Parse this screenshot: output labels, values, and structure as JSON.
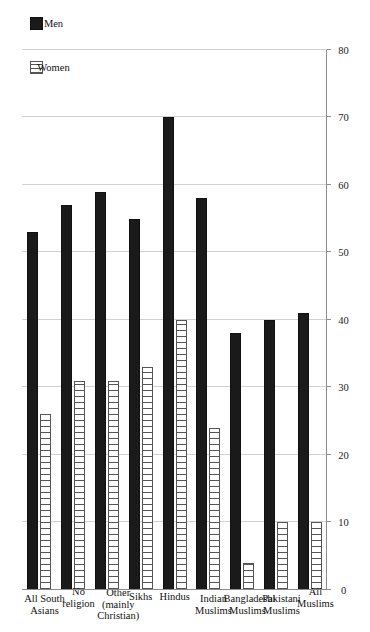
{
  "chart_data": {
    "type": "bar",
    "orientation": "horizontal-rotated",
    "title": "",
    "subtitle": "",
    "xlabel": "",
    "ylabel": "",
    "categories": [
      "All Muslims",
      "Pakistani\nMuslims",
      "Bangladeshi\nMuslims",
      "Indian\nMuslims",
      "Hindus",
      "Sikhs",
      "Other\n(mainly Christian)",
      "No religion",
      "All South\nAsians"
    ],
    "series": [
      {
        "name": "Men",
        "values": [
          41,
          40,
          38,
          58,
          70,
          55,
          59,
          57,
          53
        ]
      },
      {
        "name": "Women",
        "values": [
          10,
          10,
          4,
          24,
          40,
          33,
          31,
          31,
          26
        ]
      }
    ],
    "ylim": [
      0,
      80
    ],
    "tick_values": [
      0,
      10,
      20,
      30,
      40,
      50,
      60,
      70,
      80
    ],
    "tick_labels": [
      "0",
      "10",
      "20",
      "30",
      "40",
      "50",
      "60",
      "70",
      "80"
    ],
    "grid": true,
    "legend_position": "top-left",
    "colors": {
      "men": "#1a1a1a",
      "women": "#ffffff",
      "women_hatch": "#555555",
      "gridline": "#d2d2d2",
      "axis": "#8c8c8c",
      "background": "#ffffff"
    }
  },
  "legend": {
    "entries": [
      {
        "label": "Men",
        "pattern": "solid-fill"
      },
      {
        "label": "Women",
        "pattern": "vertical-stripes"
      }
    ]
  }
}
